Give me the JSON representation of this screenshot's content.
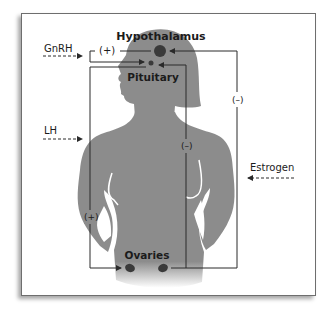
{
  "diagram": {
    "organs": {
      "hypothalamus": "Hypothalamus",
      "pituitary": "Pituitary",
      "ovaries": "Ovaries"
    },
    "hormones": {
      "gnrh": "GnRH",
      "lh": "LH",
      "estrogen": "Estrogen"
    },
    "feedback": {
      "hypothalamus_to_pituitary": "(+)",
      "pituitary_to_ovaries": "(+)",
      "ovaries_to_pituitary": "(–)",
      "ovaries_to_hypothalamus": "(–)"
    },
    "colors": {
      "silhouette": "#8c8c8c",
      "organ": "#3a3a3a",
      "line": "#2a2a2a",
      "frame": "#6e6e6e"
    }
  }
}
